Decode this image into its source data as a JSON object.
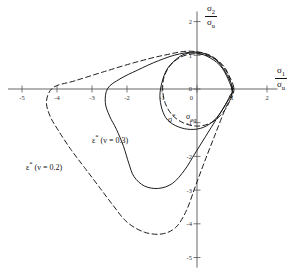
{
  "chart_data": {
    "type": "line",
    "title": "",
    "xlabel": "sigma_1 / sigma_u",
    "ylabel": "sigma_2 / sigma_u",
    "xlim": [
      -5.4,
      2.3
    ],
    "ylim": [
      -5.3,
      2.3
    ],
    "grid": false,
    "legend_position": "inline-annotations",
    "xticks": [
      -5,
      -4,
      -3,
      -2,
      -1,
      0,
      1,
      2
    ],
    "xtick_labels": [
      "-5",
      "-4",
      "-3",
      "-2",
      "-1",
      "0",
      "1",
      "2"
    ],
    "yticks": [
      2,
      1,
      0,
      -1,
      -2,
      -3,
      -4,
      -5
    ],
    "ytick_labels": [
      "2",
      "1",
      "0",
      "-1",
      "-2",
      "-3",
      "-4",
      "-5"
    ],
    "series": [
      {
        "name": "sigma*",
        "style": "solid",
        "color": "#111111",
        "points": [
          [
            1.0,
            0.0
          ],
          [
            0.72,
            0.62
          ],
          [
            0.38,
            0.92
          ],
          [
            0.02,
            1.06
          ],
          [
            -0.34,
            1.04
          ],
          [
            -0.62,
            0.86
          ],
          [
            -0.86,
            0.58
          ],
          [
            -1.0,
            0.2
          ],
          [
            -1.06,
            -0.2
          ],
          [
            -1.0,
            -0.6
          ],
          [
            -0.84,
            -0.92
          ],
          [
            -0.54,
            -1.12
          ],
          [
            -0.18,
            -1.2
          ],
          [
            0.18,
            -1.14
          ],
          [
            0.5,
            -0.92
          ],
          [
            0.76,
            -0.56
          ],
          [
            0.94,
            -0.2
          ],
          [
            1.0,
            0.0
          ]
        ]
      },
      {
        "name": "sigma_eq",
        "style": "dashed",
        "color": "#111111",
        "points": [
          [
            1.0,
            0.0
          ],
          [
            0.86,
            0.52
          ],
          [
            0.6,
            0.84
          ],
          [
            0.26,
            1.0
          ],
          [
            -0.12,
            1.04
          ],
          [
            -0.48,
            0.94
          ],
          [
            -0.76,
            0.7
          ],
          [
            -0.94,
            0.36
          ],
          [
            -0.98,
            -0.04
          ],
          [
            -0.9,
            -0.44
          ],
          [
            -0.7,
            -0.78
          ],
          [
            -0.4,
            -1.0
          ],
          [
            -0.04,
            -1.1
          ],
          [
            0.32,
            -1.04
          ],
          [
            0.64,
            -0.82
          ],
          [
            0.88,
            -0.48
          ],
          [
            0.99,
            -0.14
          ],
          [
            1.0,
            0.0
          ]
        ]
      },
      {
        "name": "epsilon* (nu = 0.3)",
        "style": "solid",
        "color": "#111111",
        "points": [
          [
            1.02,
            0.02
          ],
          [
            0.62,
            0.78
          ],
          [
            0.1,
            1.08
          ],
          [
            -0.5,
            1.04
          ],
          [
            -1.1,
            0.84
          ],
          [
            -1.7,
            0.56
          ],
          [
            -2.2,
            0.3
          ],
          [
            -2.55,
            0.02
          ],
          [
            -2.62,
            -0.4
          ],
          [
            -2.5,
            -0.8
          ],
          [
            -2.3,
            -1.2
          ],
          [
            -2.1,
            -1.7
          ],
          [
            -1.95,
            -2.2
          ],
          [
            -1.8,
            -2.6
          ],
          [
            -1.5,
            -2.88
          ],
          [
            -1.1,
            -2.95
          ],
          [
            -0.7,
            -2.8
          ],
          [
            -0.35,
            -2.4
          ],
          [
            -0.05,
            -1.9
          ],
          [
            0.25,
            -1.4
          ],
          [
            0.55,
            -0.9
          ],
          [
            0.82,
            -0.45
          ],
          [
            1.02,
            0.02
          ]
        ]
      },
      {
        "name": "epsilon* (nu = 0.2)",
        "style": "dashed",
        "color": "#111111",
        "points": [
          [
            1.05,
            0.05
          ],
          [
            0.55,
            0.88
          ],
          [
            -0.15,
            1.12
          ],
          [
            -0.95,
            1.0
          ],
          [
            -1.8,
            0.78
          ],
          [
            -2.7,
            0.5
          ],
          [
            -3.5,
            0.24
          ],
          [
            -4.1,
            0.05
          ],
          [
            -4.3,
            -0.35
          ],
          [
            -4.2,
            -0.8
          ],
          [
            -3.95,
            -1.25
          ],
          [
            -3.6,
            -1.8
          ],
          [
            -3.2,
            -2.35
          ],
          [
            -2.8,
            -2.9
          ],
          [
            -2.4,
            -3.45
          ],
          [
            -2.0,
            -3.95
          ],
          [
            -1.5,
            -4.25
          ],
          [
            -1.0,
            -4.3
          ],
          [
            -0.6,
            -4.1
          ],
          [
            -0.3,
            -3.6
          ],
          [
            -0.05,
            -2.9
          ],
          [
            0.2,
            -2.2
          ],
          [
            0.5,
            -1.4
          ],
          [
            0.8,
            -0.6
          ],
          [
            1.05,
            0.05
          ]
        ]
      }
    ],
    "annotations": [
      {
        "name": "sigma-star-label",
        "text": "σ",
        "sup": "*",
        "x": -0.85,
        "y": -1.45
      },
      {
        "name": "sigma-eq-label",
        "text": "σ",
        "sub": "eq",
        "x": -0.35,
        "y": -1.45
      },
      {
        "name": "epsilon-nu-03-label",
        "text": "ε* (ν = 0.3)",
        "x": -2.2,
        "y": -1.9
      },
      {
        "name": "epsilon-nu-02-label",
        "text": "ε* (ν = 0.2)",
        "x": -4.1,
        "y": -2.45
      }
    ]
  },
  "axes": {
    "x_axis_label": {
      "numerator": "σ",
      "numerator_sub": "1",
      "denominator": "σ",
      "denominator_sub": "u"
    },
    "y_axis_label": {
      "numerator": "σ",
      "numerator_sub": "2",
      "denominator": "σ",
      "denominator_sub": "u"
    }
  },
  "labels": {
    "sigma_star": {
      "base": "σ",
      "sup": "*"
    },
    "sigma_eq": {
      "base": "σ",
      "sub": "eq"
    },
    "eps_nu_03": {
      "base": "ε",
      "sup": "*",
      "paren": "(ν = 0.3)"
    },
    "eps_nu_02": {
      "base": "ε",
      "sup": "*",
      "paren": "(ν = 0.2)"
    }
  },
  "colors": {
    "axis": "#555555",
    "curve": "#111111",
    "text": "#111111",
    "background": "#ffffff"
  }
}
